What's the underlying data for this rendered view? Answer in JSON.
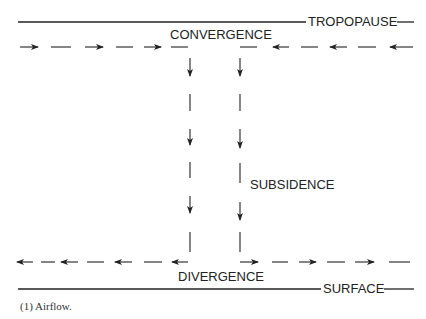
{
  "diagram": {
    "labels": {
      "top_boundary": "TROPOPAUSE",
      "upper_level": "CONVERGENCE",
      "middle": "SUBSIDENCE",
      "lower_level": "DIVERGENCE",
      "bottom_boundary": "SURFACE"
    },
    "caption": "(1)  Airflow.",
    "flows": {
      "upper_left": "rightward arrows toward center",
      "upper_right": "leftward arrows toward center",
      "vertical": "downward arrows (two columns)",
      "lower_left": "leftward arrows away from center",
      "lower_right": "rightward arrows away from center"
    },
    "colors": {
      "line": "#222222",
      "background": "#ffffff"
    }
  }
}
